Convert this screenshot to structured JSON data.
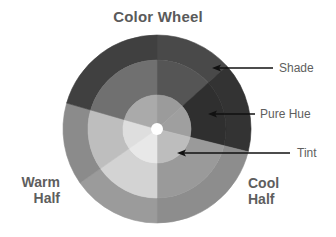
{
  "title": "Color Wheel",
  "labels": {
    "shade": "Shade",
    "pure_hue": "Pure Hue",
    "tint": "Tint"
  },
  "halves": {
    "warm": [
      "Warm",
      "Half"
    ],
    "cool": [
      "Cool",
      "Half"
    ]
  },
  "wheel": {
    "center": [
      157,
      129
    ],
    "radii": {
      "outer": 94,
      "mid": 69,
      "inner": 34,
      "hole": 6
    },
    "rings": [
      "Shade (outer)",
      "Pure Hue (middle)",
      "Tint (inner)"
    ],
    "segments": [
      {
        "name": "top-right",
        "start": -90,
        "end": -42,
        "outer": "#494949",
        "mid": "#555555",
        "inner": "#9b9b9b"
      },
      {
        "name": "right",
        "start": -42,
        "end": 14,
        "outer": "#333333",
        "mid": "#2f2f2f",
        "inner": "#9f9f9f"
      },
      {
        "name": "lower-right",
        "start": 14,
        "end": 90,
        "outer": "#8d8d8d",
        "mid": "#9a9a9a",
        "inner": "#bdbdbd"
      },
      {
        "name": "lower-left",
        "start": 90,
        "end": 145,
        "outer": "#9b9b9b",
        "mid": "#d3d3d3",
        "inner": "#e8e8e8"
      },
      {
        "name": "left",
        "start": 145,
        "end": 196,
        "outer": "#8b8b8b",
        "mid": "#bebebe",
        "inner": "#dedede"
      },
      {
        "name": "upper-left",
        "start": 196,
        "end": 270,
        "outer": "#404040",
        "mid": "#707070",
        "inner": "#aaaaaa"
      }
    ]
  },
  "arrows": [
    {
      "name": "shade-arrow",
      "tip": [
        212,
        68
      ],
      "tail": [
        273,
        68
      ]
    },
    {
      "name": "pure-hue-arrow",
      "tip": [
        208,
        114
      ],
      "tail": [
        255,
        114
      ]
    },
    {
      "name": "tint-arrow",
      "tip": [
        177,
        153
      ],
      "tail": [
        290,
        153
      ]
    }
  ],
  "colors": {
    "text": "#5e5e5e",
    "arrow": "#111111",
    "background": "#ffffff"
  }
}
